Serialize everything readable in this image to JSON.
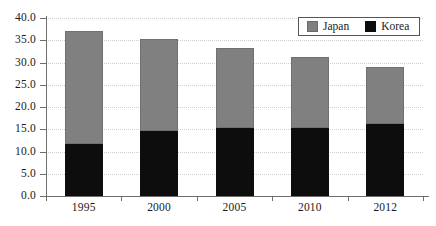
{
  "chart_data": {
    "type": "bar",
    "stacked": true,
    "title": "",
    "subtitle": "",
    "xlabel": "",
    "ylabel": "",
    "categories": [
      "1995",
      "2000",
      "2005",
      "2010",
      "2012"
    ],
    "series": [
      {
        "name": "Korea",
        "color": "#0d0d0d",
        "values": [
          11.8,
          14.5,
          15.2,
          15.3,
          16.2
        ]
      },
      {
        "name": "Japan",
        "color": "#808080",
        "values": [
          25.2,
          20.8,
          18.1,
          15.9,
          12.8
        ]
      }
    ],
    "totals": [
      37.0,
      35.3,
      33.3,
      31.2,
      29.0
    ],
    "ylim": [
      0.0,
      40.0
    ],
    "ytick_step": 5.0,
    "ytick_labels": [
      "40.0",
      "35.0",
      "30.0",
      "25.0",
      "20.0",
      "15.0",
      "10.0",
      "5.0",
      "0.0"
    ],
    "ytick_values": [
      40.0,
      35.0,
      30.0,
      25.0,
      20.0,
      15.0,
      10.0,
      5.0,
      0.0
    ],
    "grid": true,
    "grid_style": "dotted",
    "grid_color": "#cfcfcf",
    "legend_position": "top-right",
    "legend_entries": [
      {
        "label": "Japan",
        "color": "#808080"
      },
      {
        "label": "Korea",
        "color": "#0d0d0d"
      }
    ]
  }
}
